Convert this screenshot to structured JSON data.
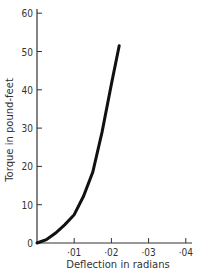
{
  "chart_data": {
    "type": "line",
    "title": "",
    "xlabel": "Deflection in radians",
    "ylabel": "Torque in pound-feet",
    "xlim": [
      0,
      0.043
    ],
    "ylim": [
      0,
      60
    ],
    "x_ticks": [
      0.01,
      0.02,
      0.03,
      0.04
    ],
    "x_tick_labels": [
      "·01",
      "·02",
      "·03",
      "·04"
    ],
    "y_ticks": [
      0,
      10,
      20,
      30,
      40,
      50,
      60
    ],
    "y_tick_labels": [
      "0",
      "10",
      "20",
      "30",
      "40",
      "50",
      "60"
    ],
    "grid": false,
    "legend": null,
    "series": [
      {
        "name": "Torque vs deflection",
        "x": [
          0,
          0.0025,
          0.005,
          0.0075,
          0.01,
          0.0125,
          0.015,
          0.0175,
          0.02,
          0.0221
        ],
        "y": [
          0,
          0.9,
          2.6,
          4.8,
          7.4,
          12.2,
          18.5,
          29.0,
          41.5,
          51.5
        ]
      }
    ]
  }
}
